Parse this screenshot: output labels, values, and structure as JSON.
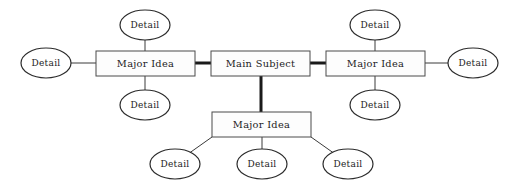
{
  "diagram": {
    "type": "mind-map",
    "background_color": "#ffffff",
    "box_stroke_color": "#4a4a4a",
    "ellipse_stroke_color": "#2b2b2b",
    "text_color": "#1c1c1c",
    "thick_edge_color": "#1a1a1a",
    "thin_edge_color": "#3a3a3a"
  },
  "nodes": {
    "center": {
      "id": "main-subject",
      "label": "Main Subject",
      "shape": "rectangle",
      "x": 211,
      "y": 51,
      "w": 99,
      "h": 25
    },
    "major_ideas": [
      {
        "id": "major-idea-left",
        "label": "Major Idea",
        "shape": "rectangle",
        "x": 96,
        "y": 51,
        "w": 99,
        "h": 25
      },
      {
        "id": "major-idea-right",
        "label": "Major Idea",
        "shape": "rectangle",
        "x": 326,
        "y": 51,
        "w": 99,
        "h": 25
      },
      {
        "id": "major-idea-bottom",
        "label": "Major  Idea",
        "shape": "rectangle",
        "x": 212,
        "y": 112,
        "w": 99,
        "h": 25
      }
    ],
    "details": [
      {
        "id": "detail-left-outer",
        "label": "Detail",
        "shape": "ellipse",
        "cx": 46,
        "cy": 63,
        "rx": 25,
        "ry": 15,
        "parent": "major-idea-left"
      },
      {
        "id": "detail-left-top",
        "label": "Detail",
        "shape": "ellipse",
        "cx": 145,
        "cy": 25,
        "rx": 25,
        "ry": 15,
        "parent": "major-idea-left"
      },
      {
        "id": "detail-left-bottom",
        "label": "Detail",
        "shape": "ellipse",
        "cx": 145,
        "cy": 105,
        "rx": 25,
        "ry": 15,
        "parent": "major-idea-left"
      },
      {
        "id": "detail-right-top",
        "label": "Detail",
        "shape": "ellipse",
        "cx": 375,
        "cy": 25,
        "rx": 25,
        "ry": 15,
        "parent": "major-idea-right"
      },
      {
        "id": "detail-right-bottom",
        "label": "Detail",
        "shape": "ellipse",
        "cx": 375,
        "cy": 105,
        "rx": 25,
        "ry": 15,
        "parent": "major-idea-right"
      },
      {
        "id": "detail-right-outer",
        "label": "Detail",
        "shape": "ellipse",
        "cx": 473,
        "cy": 63,
        "rx": 25,
        "ry": 15,
        "parent": "major-idea-right"
      },
      {
        "id": "detail-bottom-left",
        "label": "Detail",
        "shape": "ellipse",
        "cx": 175,
        "cy": 164,
        "rx": 25,
        "ry": 15,
        "parent": "major-idea-bottom"
      },
      {
        "id": "detail-bottom-mid",
        "label": "Detail",
        "shape": "ellipse",
        "cx": 262,
        "cy": 164,
        "rx": 25,
        "ry": 15,
        "parent": "major-idea-bottom"
      },
      {
        "id": "detail-bottom-right",
        "label": "Detail",
        "shape": "ellipse",
        "cx": 348,
        "cy": 164,
        "rx": 25,
        "ry": 15,
        "parent": "major-idea-bottom"
      }
    ]
  },
  "edges": {
    "thick": [
      {
        "id": "edge-center-left",
        "from": "main-subject",
        "to": "major-idea-left",
        "x1": 195,
        "y1": 63,
        "x2": 211,
        "y2": 63
      },
      {
        "id": "edge-center-right",
        "from": "main-subject",
        "to": "major-idea-right",
        "x1": 310,
        "y1": 63,
        "x2": 326,
        "y2": 63
      },
      {
        "id": "edge-center-bottom",
        "from": "main-subject",
        "to": "major-idea-bottom",
        "x1": 261,
        "y1": 76,
        "x2": 261,
        "y2": 112
      }
    ],
    "thin": [
      {
        "id": "edge-left-outer",
        "x1": 71,
        "y1": 63,
        "x2": 96,
        "y2": 63
      },
      {
        "id": "edge-left-top",
        "x1": 145,
        "y1": 40,
        "x2": 145,
        "y2": 51
      },
      {
        "id": "edge-left-bottom",
        "x1": 145,
        "y1": 76,
        "x2": 145,
        "y2": 90
      },
      {
        "id": "edge-right-top",
        "x1": 375,
        "y1": 40,
        "x2": 375,
        "y2": 51
      },
      {
        "id": "edge-right-bottom",
        "x1": 375,
        "y1": 76,
        "x2": 375,
        "y2": 90
      },
      {
        "id": "edge-right-outer",
        "x1": 425,
        "y1": 63,
        "x2": 448,
        "y2": 63
      },
      {
        "id": "edge-bottom-left-diag",
        "x1": 212,
        "y1": 137,
        "x2": 188,
        "y2": 154
      },
      {
        "id": "edge-bottom-mid-vert",
        "x1": 262,
        "y1": 137,
        "x2": 262,
        "y2": 149
      },
      {
        "id": "edge-bottom-right-diag",
        "x1": 311,
        "y1": 137,
        "x2": 335,
        "y2": 154
      }
    ]
  }
}
